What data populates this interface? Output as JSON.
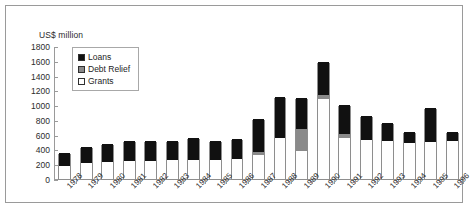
{
  "chart_data": {
    "type": "bar",
    "title": "",
    "subtitle": "",
    "xlabel": "",
    "ylabel": "US$ million",
    "ylim": [
      0,
      1800
    ],
    "ytick_step": 200,
    "yticks": [
      0,
      200,
      400,
      600,
      800,
      1000,
      1200,
      1400,
      1600,
      1800
    ],
    "grid": false,
    "stacked": true,
    "legend_position": "top-left-inside",
    "categories": [
      "1978",
      "1979",
      "1980",
      "1981",
      "1982",
      "1983",
      "1984",
      "1985",
      "1986",
      "1987",
      "1988",
      "1989",
      "1990",
      "1991",
      "1992",
      "1993",
      "1994",
      "1995",
      "1996"
    ],
    "series": [
      {
        "name": "Grants",
        "color": "#ffffff",
        "values": [
          170,
          215,
          230,
          250,
          250,
          255,
          255,
          260,
          265,
          320,
          560,
          375,
          1080,
          560,
          530,
          520,
          490,
          500,
          520
        ]
      },
      {
        "name": "Debt Relief",
        "color": "#8a8a8a",
        "values": [
          0,
          0,
          0,
          0,
          0,
          0,
          0,
          0,
          0,
          45,
          0,
          300,
          60,
          45,
          0,
          0,
          0,
          0,
          0
        ]
      },
      {
        "name": "Loans",
        "color": "#111111",
        "values": [
          180,
          215,
          250,
          265,
          265,
          265,
          305,
          250,
          270,
          450,
          555,
          420,
          440,
          400,
          320,
          240,
          150,
          460,
          110
        ]
      }
    ],
    "totals": [
      350,
      430,
      480,
      515,
      515,
      520,
      560,
      510,
      535,
      815,
      1115,
      1095,
      1580,
      1005,
      850,
      760,
      640,
      960,
      630
    ],
    "legend": [
      {
        "key": "loans",
        "label": "Loans",
        "color": "#111111"
      },
      {
        "key": "debt",
        "label": "Debt Relief",
        "color": "#8a8a8a"
      },
      {
        "key": "grants",
        "label": "Grants",
        "color": "#ffffff"
      }
    ]
  }
}
